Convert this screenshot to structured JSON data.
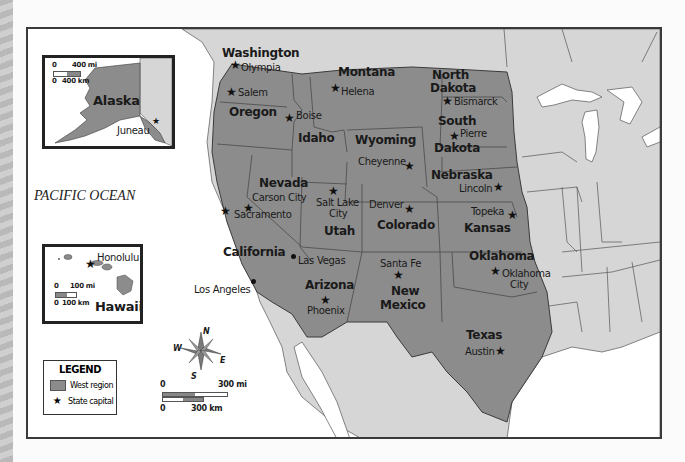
{
  "map": {
    "title": "West region of the United States",
    "ocean_label": "PACIFIC OCEAN",
    "colors": {
      "west_region": "#8c8c8c",
      "other_land": "#d6d6d6",
      "water": "#ffffff",
      "border": "#3a3a3a"
    },
    "states": [
      {
        "name": "Washington",
        "capital": "Olympia"
      },
      {
        "name": "Oregon",
        "capital": "Salem"
      },
      {
        "name": "Idaho",
        "capital": "Boise"
      },
      {
        "name": "Montana",
        "capital": "Helena"
      },
      {
        "name": "Wyoming",
        "capital": "Cheyenne"
      },
      {
        "name": "North Dakota",
        "capital": "Bismarck"
      },
      {
        "name": "South Dakota",
        "capital": "Pierre"
      },
      {
        "name": "Nebraska",
        "capital": "Lincoln"
      },
      {
        "name": "Kansas",
        "capital": "Topeka"
      },
      {
        "name": "Colorado",
        "capital": "Denver"
      },
      {
        "name": "Utah",
        "capital": "Salt Lake City"
      },
      {
        "name": "Nevada",
        "capital": "Carson City"
      },
      {
        "name": "California",
        "capital": "Sacramento"
      },
      {
        "name": "Arizona",
        "capital": "Phoenix"
      },
      {
        "name": "New Mexico",
        "capital": "Santa Fe"
      },
      {
        "name": "Oklahoma",
        "capital": "Oklahoma City"
      },
      {
        "name": "Texas",
        "capital": "Austin"
      }
    ],
    "labels": {
      "washington": "Washington",
      "olympia": "Olympia",
      "oregon": "Oregon",
      "salem": "Salem",
      "idaho": "Idaho",
      "boise": "Boise",
      "montana": "Montana",
      "helena": "Helena",
      "wyoming": "Wyoming",
      "cheyenne": "Cheyenne",
      "north": "North",
      "dakota_n": "Dakota",
      "bismarck": "Bismarck",
      "south": "South",
      "dakota_s": "Dakota",
      "pierre": "Pierre",
      "nebraska": "Nebraska",
      "lincoln": "Lincoln",
      "kansas": "Kansas",
      "topeka": "Topeka",
      "colorado": "Colorado",
      "denver": "Denver",
      "utah": "Utah",
      "salt_lake": "Salt Lake",
      "city_slc": "City",
      "nevada": "Nevada",
      "carson_city": "Carson City",
      "california": "California",
      "sacramento": "Sacramento",
      "los_angeles": "Los Angeles",
      "las_vegas": "Las Vegas",
      "arizona": "Arizona",
      "phoenix": "Phoenix",
      "new": "New",
      "mexico": "Mexico",
      "santa_fe": "Santa Fe",
      "oklahoma": "Oklahoma",
      "okc_1": "Oklahoma",
      "okc_2": "City",
      "texas": "Texas",
      "austin": "Austin"
    },
    "star_glyph": "★"
  },
  "insets": {
    "alaska": {
      "name": "Alaska",
      "capital": "Juneau",
      "scale_mi": "400 mi",
      "scale_km": "400 km",
      "zero": "0"
    },
    "hawaii": {
      "name": "Hawaii",
      "capital": "Honolulu",
      "scale_mi": "100 mi",
      "scale_km": "100 km",
      "zero": "0"
    }
  },
  "legend": {
    "title": "LEGEND",
    "items": [
      {
        "label": "West region",
        "icon": "gray-swatch"
      },
      {
        "label": "State capital",
        "icon": "star-icon"
      }
    ]
  },
  "compass": {
    "n": "N",
    "s": "S",
    "e": "E",
    "w": "W"
  },
  "scale_bar": {
    "zero": "0",
    "miles": "300 mi",
    "km": "300 km"
  }
}
